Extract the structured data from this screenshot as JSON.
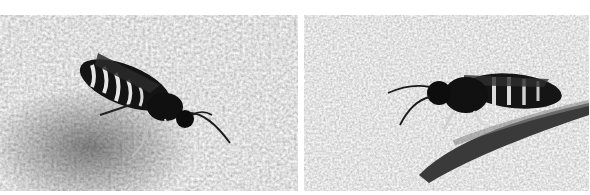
{
  "figure": {
    "background": "#ffffff",
    "panels": [
      {
        "id": "left",
        "subject": "black-and-white banded wasp standing on sand, head to the right, antennae curving down",
        "tone": "grayscale"
      },
      {
        "id": "right",
        "subject": "black-and-white banded wasp on sand beside a dark elongated object (twig/leaf) curving from lower left to right",
        "tone": "grayscale"
      }
    ]
  }
}
